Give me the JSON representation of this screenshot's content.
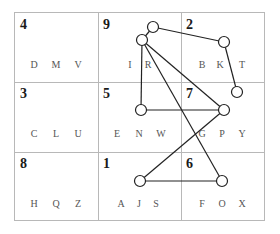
{
  "puzzle": {
    "cells": [
      {
        "number": "4",
        "letters": [
          "D",
          "M",
          "V"
        ]
      },
      {
        "number": "9",
        "letters": [
          "I",
          "R",
          ""
        ]
      },
      {
        "number": "2",
        "letters": [
          "B",
          "K",
          "T"
        ]
      },
      {
        "number": "3",
        "letters": [
          "C",
          "L",
          "U"
        ]
      },
      {
        "number": "5",
        "letters": [
          "E",
          "N",
          "W"
        ]
      },
      {
        "number": "7",
        "letters": [
          "G",
          "P",
          "Y"
        ]
      },
      {
        "number": "8",
        "letters": [
          "H",
          "Q",
          "Z"
        ]
      },
      {
        "number": "1",
        "letters": [
          "A",
          "J",
          "S"
        ]
      },
      {
        "number": "6",
        "letters": [
          "F",
          "O",
          "X"
        ]
      }
    ],
    "colors": {
      "grid": "#b8b8b8",
      "line": "#222222",
      "text": "#1a1a1a",
      "letter": "#555555"
    }
  }
}
